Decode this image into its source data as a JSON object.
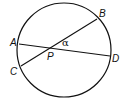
{
  "diagram": {
    "type": "circle-intersecting-chords",
    "circle": {
      "cx": 64,
      "cy": 50,
      "r": 47
    },
    "points": {
      "A": {
        "label": "A",
        "x": 19,
        "y": 44
      },
      "B": {
        "label": "B",
        "x": 97,
        "y": 19
      },
      "C": {
        "label": "C",
        "x": 21,
        "y": 66
      },
      "D": {
        "label": "D",
        "x": 110,
        "y": 56
      },
      "P": {
        "label": "P",
        "x": 50,
        "y": 48
      }
    },
    "chords": [
      {
        "from": "A",
        "to": "D"
      },
      {
        "from": "C",
        "to": "B"
      }
    ],
    "angle": {
      "label": "α",
      "vertex": "P",
      "between": [
        "PB",
        "PD"
      ]
    },
    "stroke_color": "#111111"
  }
}
